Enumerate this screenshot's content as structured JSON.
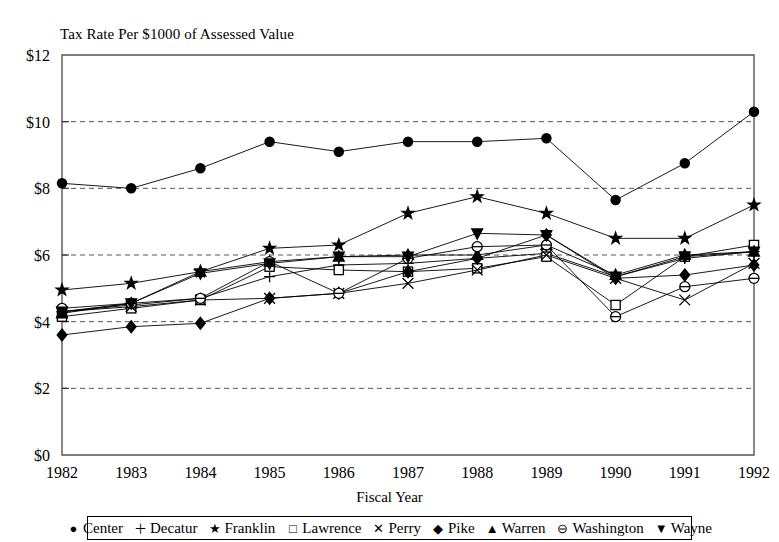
{
  "chart_data": {
    "type": "line",
    "title": "Tax Rate Per $1000 of Assessed Value",
    "xlabel": "Fiscal Year",
    "ylabel": "",
    "categories": [
      "1982",
      "1983",
      "1984",
      "1985",
      "1986",
      "1987",
      "1988",
      "1989",
      "1990",
      "1991",
      "1992"
    ],
    "x": [
      1982,
      1983,
      1984,
      1985,
      1986,
      1987,
      1988,
      1989,
      1990,
      1991,
      1992
    ],
    "ylim": [
      0,
      12
    ],
    "yticks": [
      0,
      2,
      4,
      6,
      8,
      10,
      12
    ],
    "ytick_labels": [
      "$0",
      "$2",
      "$4",
      "$6",
      "$8",
      "$10",
      "$12"
    ],
    "grid": "horizontal-dashed",
    "legend_position": "bottom",
    "series": [
      {
        "name": "Center",
        "marker": "filled-circle",
        "glyph": "●",
        "values": [
          8.15,
          8.0,
          8.6,
          9.4,
          9.1,
          9.4,
          9.4,
          9.5,
          7.65,
          8.75,
          10.3
        ]
      },
      {
        "name": "Decatur",
        "marker": "plus",
        "glyph": "＋",
        "values": [
          4.3,
          4.5,
          4.7,
          5.35,
          5.7,
          5.75,
          5.9,
          6.05,
          5.35,
          5.9,
          6.1
        ]
      },
      {
        "name": "Franklin",
        "marker": "star",
        "glyph": "★",
        "values": [
          4.95,
          5.15,
          5.5,
          6.2,
          6.3,
          7.25,
          7.75,
          7.25,
          6.5,
          6.5,
          7.5
        ]
      },
      {
        "name": "Lawrence",
        "marker": "open-square",
        "glyph": "□",
        "values": [
          4.15,
          4.4,
          4.65,
          5.65,
          5.55,
          5.5,
          5.6,
          5.95,
          4.5,
          5.95,
          6.3
        ]
      },
      {
        "name": "Perry",
        "marker": "x-cross",
        "glyph": "✕",
        "values": [
          4.3,
          4.45,
          4.65,
          4.7,
          4.85,
          5.15,
          5.55,
          6.0,
          5.3,
          4.65,
          5.75
        ]
      },
      {
        "name": "Pike",
        "marker": "filled-diamond",
        "glyph": "◆",
        "values": [
          3.6,
          3.85,
          3.95,
          4.7,
          4.85,
          5.5,
          5.9,
          6.6,
          5.3,
          5.4,
          5.7
        ]
      },
      {
        "name": "Warren",
        "marker": "filled-triangle-up",
        "glyph": "▲",
        "values": [
          4.25,
          4.55,
          5.5,
          5.8,
          5.95,
          6.0,
          6.0,
          6.3,
          5.4,
          6.0,
          6.1
        ]
      },
      {
        "name": "Washington",
        "marker": "circle-with-bar",
        "glyph": "⊖",
        "values": [
          4.4,
          4.55,
          4.7,
          5.8,
          4.85,
          5.9,
          6.25,
          6.3,
          4.15,
          5.05,
          5.3
        ]
      },
      {
        "name": "Wayne",
        "marker": "filled-triangle-down",
        "glyph": "▼",
        "values": [
          4.3,
          4.55,
          5.45,
          5.75,
          5.95,
          5.95,
          6.65,
          6.6,
          5.35,
          5.95,
          6.1
        ]
      }
    ]
  },
  "legend": {
    "items": [
      {
        "label": "Center",
        "glyph": "●"
      },
      {
        "label": "Decatur",
        "glyph": "＋"
      },
      {
        "label": "Franklin",
        "glyph": "★"
      },
      {
        "label": "Lawrence",
        "glyph": "□"
      },
      {
        "label": "Perry",
        "glyph": "✕"
      },
      {
        "label": "Pike",
        "glyph": "◆"
      },
      {
        "label": "Warren",
        "glyph": "▲"
      },
      {
        "label": "Washington",
        "glyph": "⊖"
      },
      {
        "label": "Wayne",
        "glyph": "▼"
      }
    ]
  }
}
